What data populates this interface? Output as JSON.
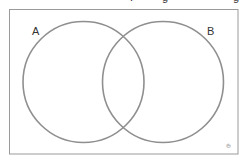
{
  "diagram": {
    "type": "venn",
    "sets": [
      {
        "label": "A",
        "cx": 83.5,
        "cy": 82,
        "r": 61
      },
      {
        "label": "B",
        "cx": 163,
        "cy": 82,
        "r": 61
      }
    ],
    "frame": {
      "x": 9,
      "y": 9,
      "width": 229,
      "height": 145
    },
    "stroke_color": "#8f8f8f",
    "frame_color": "#9a9a9a",
    "credit_mark": "©"
  }
}
